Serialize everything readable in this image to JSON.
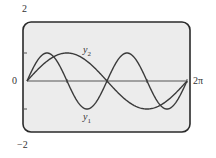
{
  "chart_data": {
    "type": "line",
    "title": "",
    "xlabel": "",
    "ylabel": "",
    "xlim": [
      0,
      6.2832
    ],
    "ylim": [
      -2,
      2
    ],
    "x_tick_labels": [
      "0",
      "2π"
    ],
    "y_tick_labels": [
      "2",
      "0",
      "−2"
    ],
    "y_minor_ticks": [
      1,
      -1
    ],
    "x_minor_ticks": [
      "π/2",
      "π",
      "3π/2"
    ],
    "grid": false,
    "series": [
      {
        "name": "y1",
        "label": "y₁",
        "function": "sin(2x)",
        "x": [
          0,
          0.785,
          1.571,
          2.356,
          3.142,
          3.927,
          4.712,
          5.498,
          6.283
        ],
        "values": [
          0,
          1,
          0,
          -1,
          0,
          1,
          0,
          -1,
          0
        ]
      },
      {
        "name": "y2",
        "label": "y₂",
        "function": "sin(x)",
        "x": [
          0,
          1.571,
          3.142,
          4.712,
          6.283
        ],
        "values": [
          0,
          1,
          0,
          -1,
          0
        ]
      }
    ]
  },
  "labels": {
    "y_top": "2",
    "y_zero": "0",
    "y_bottom": "−2",
    "x_end": "2π",
    "y1_base": "y",
    "y1_sub": "1",
    "y2_base": "y",
    "y2_sub": "2"
  },
  "colors": {
    "background": "#ececec",
    "frame": "#2a2a2a",
    "curve": "#3a3a3a",
    "axis": "#555555"
  }
}
